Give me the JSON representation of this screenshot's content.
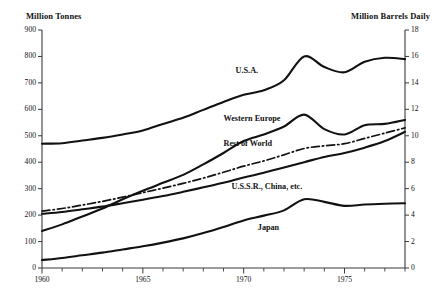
{
  "chart_data": {
    "type": "line",
    "title": "",
    "subtitle": "",
    "xlabel": "",
    "ylabel": "Million Tonnes",
    "y2label": "Million Barrels Daily",
    "grid": false,
    "legend_position": "inline-labels",
    "xlim": [
      1960,
      1978
    ],
    "ylim": [
      0,
      900
    ],
    "y2lim": [
      0,
      18
    ],
    "yticks": [
      0,
      100,
      200,
      300,
      400,
      500,
      600,
      700,
      800,
      900
    ],
    "ytick_labels": [
      "0",
      "100",
      "200",
      "300",
      "400",
      "500",
      "600",
      "700",
      "800",
      "900"
    ],
    "y2ticks": [
      0,
      2,
      4,
      6,
      8,
      10,
      12,
      14,
      16,
      18
    ],
    "y2tick_labels": [
      "0",
      "2",
      "4",
      "6",
      "8",
      "10",
      "12",
      "14",
      "16",
      "18"
    ],
    "xticks_major": [
      1960,
      1965,
      1970,
      1975
    ],
    "xtick_labels": [
      "1960",
      "1965",
      "1970",
      "1975"
    ],
    "xticks_minor": [
      1961,
      1962,
      1963,
      1964,
      1966,
      1967,
      1968,
      1969,
      1971,
      1972,
      1973,
      1974,
      1976,
      1977,
      1978
    ],
    "x": [
      1960,
      1961,
      1962,
      1963,
      1964,
      1965,
      1966,
      1967,
      1968,
      1969,
      1970,
      1971,
      1972,
      1973,
      1974,
      1975,
      1976,
      1977,
      1978
    ],
    "series": [
      {
        "name": "U.S.A.",
        "style": "solid",
        "color": "#111111",
        "values": [
          470,
          472,
          482,
          492,
          505,
          520,
          545,
          568,
          598,
          628,
          655,
          672,
          710,
          800,
          760,
          740,
          780,
          795,
          790
        ]
      },
      {
        "name": "Western Europe",
        "style": "solid",
        "color": "#111111",
        "values": [
          140,
          165,
          195,
          225,
          260,
          292,
          322,
          352,
          392,
          435,
          480,
          505,
          535,
          580,
          525,
          505,
          540,
          545,
          560
        ]
      },
      {
        "name": "Rest of World",
        "style": "dash-dot",
        "color": "#111111",
        "values": [
          215,
          225,
          238,
          252,
          268,
          285,
          302,
          320,
          340,
          362,
          385,
          405,
          428,
          452,
          462,
          470,
          490,
          510,
          530
        ]
      },
      {
        "name": "U.S.S.R., China, etc.",
        "style": "solid",
        "color": "#111111",
        "values": [
          205,
          212,
          222,
          232,
          245,
          258,
          272,
          288,
          305,
          322,
          342,
          360,
          380,
          400,
          420,
          435,
          455,
          480,
          515
        ]
      },
      {
        "name": "Japan",
        "style": "solid",
        "color": "#111111",
        "values": [
          30,
          38,
          48,
          58,
          70,
          82,
          96,
          112,
          132,
          155,
          180,
          198,
          218,
          260,
          250,
          235,
          240,
          243,
          245
        ]
      }
    ],
    "series_label_positions": [
      {
        "name": "U.S.A.",
        "x": 1969.6,
        "y": 745
      },
      {
        "name": "Western Europe",
        "x": 1969.0,
        "y": 565
      },
      {
        "name": "Rest of World",
        "x": 1969.0,
        "y": 470
      },
      {
        "name": "U.S.S.R., China, etc.",
        "x": 1969.4,
        "y": 305
      },
      {
        "name": "Japan",
        "x": 1970.7,
        "y": 150
      }
    ]
  }
}
